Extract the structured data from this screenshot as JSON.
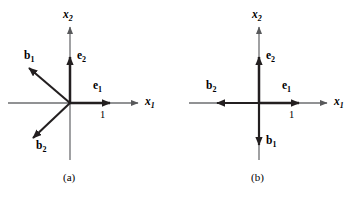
{
  "figure": {
    "background_color": "#ffffff",
    "stroke_color": "#231f20",
    "axis_color": "#6d6e71",
    "width": 352,
    "height": 198
  },
  "panels": [
    {
      "id": "a",
      "caption": "(a)",
      "origin": {
        "x": 70,
        "y": 103
      },
      "axes": [
        {
          "name": "x1",
          "label_main": "x",
          "label_sub": "1",
          "direction": "horizontal-right",
          "label_x": 145,
          "label_y": 97
        },
        {
          "name": "x2",
          "label_main": "x",
          "label_sub": "2",
          "direction": "vertical-up",
          "label_x": 63,
          "label_y": 9
        }
      ],
      "vectors": [
        {
          "name": "e1",
          "label_main": "e",
          "label_sub": "1",
          "tip": {
            "x": 110,
            "y": 103
          },
          "label_x": 93,
          "label_y": 81
        },
        {
          "name": "e2",
          "label_main": "e",
          "label_sub": "2",
          "tip": {
            "x": 70,
            "y": 57
          },
          "label_x": 76,
          "label_y": 51
        },
        {
          "name": "b1",
          "label_main": "b",
          "label_sub": "1",
          "tip": {
            "x": 29,
            "y": 68
          },
          "label_x": 24,
          "label_y": 51
        },
        {
          "name": "b2",
          "label_main": "b",
          "label_sub": "2",
          "tip": {
            "x": 33,
            "y": 138
          },
          "label_x": 36,
          "label_y": 141
        }
      ],
      "tick": {
        "label": "1",
        "x": 100,
        "y": 110
      }
    },
    {
      "id": "b",
      "caption": "(b)",
      "origin": {
        "x": 259,
        "y": 103
      },
      "axes": [
        {
          "name": "x1",
          "label_main": "x",
          "label_sub": "1",
          "direction": "horizontal-right",
          "label_x": 334,
          "label_y": 97
        },
        {
          "name": "x2",
          "label_main": "x",
          "label_sub": "2",
          "direction": "vertical-up",
          "label_x": 252,
          "label_y": 9
        }
      ],
      "vectors": [
        {
          "name": "e1",
          "label_main": "e",
          "label_sub": "1",
          "tip": {
            "x": 299,
            "y": 103
          },
          "label_x": 282,
          "label_y": 81
        },
        {
          "name": "e2",
          "label_main": "e",
          "label_sub": "2",
          "tip": {
            "x": 259,
            "y": 57
          },
          "label_x": 265,
          "label_y": 51
        },
        {
          "name": "b1",
          "label_main": "b",
          "label_sub": "1",
          "tip": {
            "x": 259,
            "y": 145
          },
          "label_x": 265,
          "label_y": 136
        },
        {
          "name": "b2",
          "label_main": "b",
          "label_sub": "2",
          "tip": {
            "x": 217,
            "y": 103
          },
          "label_x": 206,
          "label_y": 81
        }
      ],
      "tick": {
        "label": "1",
        "x": 289,
        "y": 110
      }
    }
  ],
  "captions": {
    "a": {
      "text": "(a)",
      "x": 63,
      "y": 173
    },
    "b": {
      "text": "(b)",
      "x": 251,
      "y": 173
    }
  }
}
